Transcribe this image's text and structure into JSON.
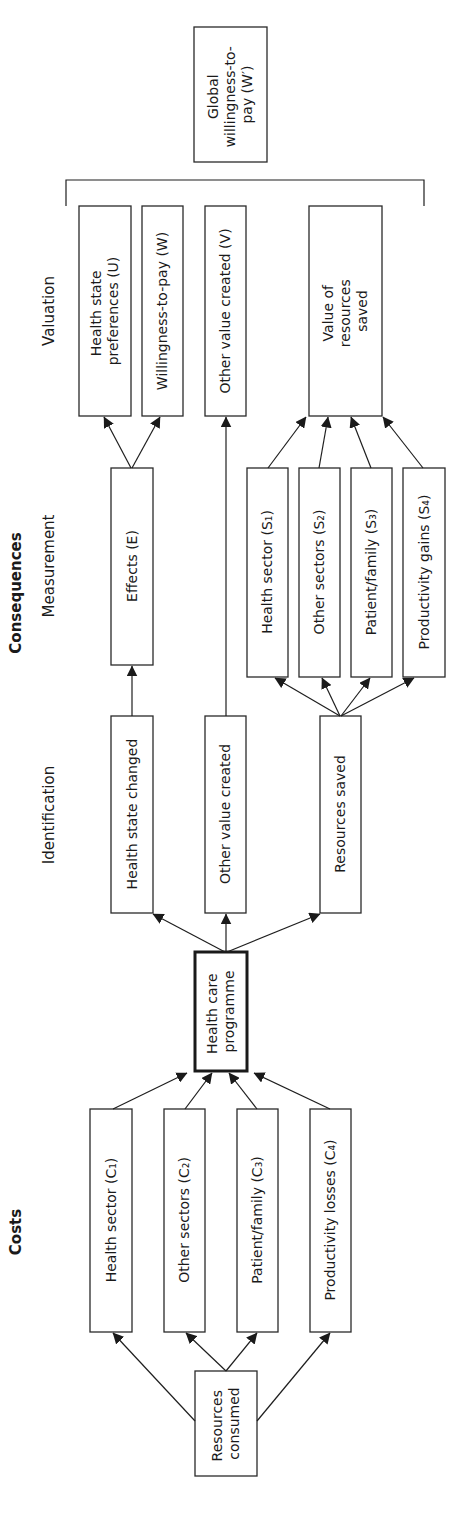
{
  "headers": {
    "costs": "Costs",
    "consequences": "Consequences",
    "identification": "Identification",
    "measurement": "Measurement",
    "valuation": "Valuation"
  },
  "nodes": {
    "global_wtp": {
      "line1": "Global",
      "line2": "willingness-to-",
      "line3": "pay (W′)"
    },
    "health_state_preferences": {
      "line1": "Health state",
      "line2": "preferences (U)"
    },
    "willingness_to_pay": "Willingness-to-pay (W)",
    "other_value_created_v": "Other value created (V)",
    "value_resources_saved": {
      "line1": "Value of",
      "line2": "resources",
      "line3": "saved"
    },
    "effects": "Effects (E)",
    "saved_health_sector": "Health sector (S₁)",
    "saved_other_sectors": "Other sectors (S₂)",
    "saved_patient_family": "Patient/family (S₃)",
    "saved_productivity_gains": "Productivity gains (S₄)",
    "health_state_changed": "Health state changed",
    "other_value_created": "Other value created",
    "resources_saved": "Resources saved",
    "health_care_programme": {
      "line1": "Health care",
      "line2": "programme"
    },
    "cost_health_sector": "Health sector (C₁)",
    "cost_other_sectors": "Other sectors (C₂)",
    "cost_patient_family": "Patient/family (C₃)",
    "cost_productivity_losses": "Productivity losses (C₄)",
    "resources_consumed": {
      "line1": "Resources",
      "line2": "consumed"
    }
  },
  "colors": {
    "stroke": "#1e1e1e",
    "background": "#ffffff",
    "text": "#1a1a1a"
  }
}
